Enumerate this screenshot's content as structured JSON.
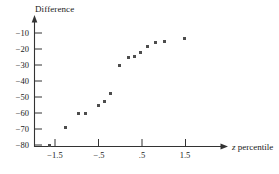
{
  "chart_data": {
    "type": "scatter",
    "title": "",
    "subtitle": "",
    "xlabel": "z percentile",
    "ylabel": "Difference",
    "xlabel_italic_part": "z",
    "xlabel_rest": " percentile",
    "xlim": [
      -1.85,
      1.95
    ],
    "ylim": [
      -84,
      -6
    ],
    "grid": false,
    "legend": null,
    "xticks": [
      -1.5,
      -0.5,
      0.5,
      1.5
    ],
    "xtick_labels": [
      "−1.5",
      "−.5",
      ".5",
      "1.5"
    ],
    "yticks": [
      -10,
      -20,
      -30,
      -40,
      -50,
      -60,
      -70,
      -80
    ],
    "ytick_labels": [
      "−10",
      "−20",
      "−30",
      "−40",
      "−50",
      "−60",
      "−70",
      "−80"
    ],
    "marker": "square",
    "marker_color": "#4d4d4d",
    "marker_size_px": 3,
    "axis_color": "#333333",
    "x": [
      -1.62,
      -1.27,
      -0.95,
      -0.79,
      -0.51,
      -0.37,
      -0.23,
      -0.02,
      0.18,
      0.32,
      0.47,
      0.62,
      0.82,
      1.02,
      1.47
    ],
    "y": [
      -80,
      -69,
      -60.5,
      -60,
      -55,
      -53,
      -48,
      -30,
      -25.5,
      -24.5,
      -22,
      -18.5,
      -16,
      -15.5,
      -13.5
    ],
    "points": [
      {
        "x": -1.62,
        "y": -80
      },
      {
        "x": -1.27,
        "y": -69
      },
      {
        "x": -0.95,
        "y": -60.5
      },
      {
        "x": -0.79,
        "y": -60
      },
      {
        "x": -0.51,
        "y": -55
      },
      {
        "x": -0.37,
        "y": -53
      },
      {
        "x": -0.23,
        "y": -48
      },
      {
        "x": -0.02,
        "y": -30
      },
      {
        "x": 0.18,
        "y": -25.5
      },
      {
        "x": 0.32,
        "y": -24.5
      },
      {
        "x": 0.47,
        "y": -22
      },
      {
        "x": 0.62,
        "y": -18.5
      },
      {
        "x": 0.82,
        "y": -16
      },
      {
        "x": 1.02,
        "y": -15.5
      },
      {
        "x": 1.47,
        "y": -13.5
      }
    ]
  }
}
